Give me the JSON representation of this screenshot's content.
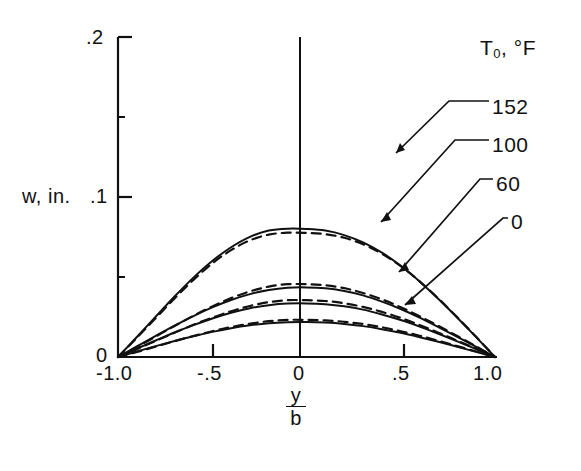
{
  "figure": {
    "kind": "line-chart",
    "background": "#ffffff",
    "ink": "#111111"
  },
  "axes": {
    "y_title": "w, in.",
    "x_title_numerator": "y",
    "x_title_denominator": "b",
    "x_ticks": [
      "-1.0",
      "-.5",
      "0",
      ".5",
      "1.0"
    ],
    "x_tick_values": [
      -1.0,
      -0.5,
      0,
      0.5,
      1.0
    ],
    "y_ticks": [
      "0",
      ".1",
      ".2"
    ],
    "y_tick_values": [
      0,
      0.1,
      0.2
    ]
  },
  "legend": {
    "title": "T",
    "title_sub": "0",
    "title_rest": ", °F",
    "title_full": "T0, °F",
    "entries": [
      {
        "label": "152",
        "value": 152
      },
      {
        "label": "100",
        "value": 100
      },
      {
        "label": "60",
        "value": 60
      },
      {
        "label": "0",
        "value": 0
      }
    ]
  },
  "chart_data": {
    "type": "line",
    "title": "",
    "subtitle": "",
    "xlabel": "y/b",
    "ylabel": "w, in.",
    "xlim": [
      -1.0,
      1.0
    ],
    "ylim": [
      0,
      0.2
    ],
    "grid": false,
    "legend_position": "right",
    "legend_title": "T0, °F",
    "x": [
      -1.0,
      -0.9,
      -0.8,
      -0.7,
      -0.6,
      -0.5,
      -0.4,
      -0.3,
      -0.2,
      -0.1,
      0.0,
      0.1,
      0.2,
      0.3,
      0.4,
      0.5,
      0.6,
      0.7,
      0.8,
      0.9,
      1.0
    ],
    "series": [
      {
        "name": "152",
        "linestyle": "solid",
        "note": "theory",
        "peak": 0.08,
        "values": [
          0.0,
          0.0125,
          0.0252,
          0.0378,
          0.0496,
          0.06,
          0.0686,
          0.0751,
          0.079,
          0.0802,
          0.08,
          0.079,
          0.0762,
          0.0716,
          0.0652,
          0.057,
          0.0472,
          0.0362,
          0.0245,
          0.0124,
          0.0
        ]
      },
      {
        "name": "152",
        "linestyle": "dashed",
        "note": "experiment",
        "peak": 0.0775,
        "values": [
          0.0,
          0.012,
          0.0243,
          0.0366,
          0.0482,
          0.0585,
          0.0668,
          0.0729,
          0.0765,
          0.0777,
          0.0775,
          0.0768,
          0.0745,
          0.0705,
          0.0646,
          0.0568,
          0.0473,
          0.0365,
          0.0248,
          0.0126,
          0.0
        ]
      },
      {
        "name": "100",
        "linestyle": "solid",
        "note": "theory",
        "peak": 0.0435,
        "values": [
          0.0,
          0.0066,
          0.0132,
          0.0196,
          0.0256,
          0.031,
          0.0356,
          0.0393,
          0.0419,
          0.0433,
          0.0435,
          0.0429,
          0.0412,
          0.0385,
          0.0346,
          0.03,
          0.0246,
          0.0187,
          0.0126,
          0.0063,
          0.0
        ]
      },
      {
        "name": "100",
        "linestyle": "dashed",
        "note": "experiment",
        "peak": 0.0455,
        "values": [
          0.0,
          0.0062,
          0.0128,
          0.0194,
          0.0258,
          0.0316,
          0.0368,
          0.041,
          0.044,
          0.0455,
          0.0455,
          0.0448,
          0.043,
          0.04,
          0.036,
          0.0311,
          0.0255,
          0.0194,
          0.0131,
          0.0066,
          0.0
        ]
      },
      {
        "name": "60",
        "linestyle": "solid",
        "note": "theory",
        "peak": 0.0335,
        "values": [
          0.0,
          0.0052,
          0.0103,
          0.0153,
          0.0199,
          0.0241,
          0.0277,
          0.0305,
          0.0324,
          0.0334,
          0.0335,
          0.033,
          0.0317,
          0.0296,
          0.0266,
          0.0231,
          0.019,
          0.0145,
          0.0098,
          0.0049,
          0.0
        ]
      },
      {
        "name": "60",
        "linestyle": "dashed",
        "note": "experiment",
        "peak": 0.0355,
        "values": [
          0.0,
          0.0049,
          0.0101,
          0.0152,
          0.0201,
          0.0246,
          0.0286,
          0.0319,
          0.0343,
          0.0355,
          0.0355,
          0.035,
          0.0336,
          0.0313,
          0.0282,
          0.0244,
          0.02,
          0.0152,
          0.0102,
          0.0051,
          0.0
        ]
      },
      {
        "name": "0",
        "linestyle": "solid",
        "note": "theory",
        "peak": 0.0218,
        "values": [
          0.0,
          0.0034,
          0.0068,
          0.01,
          0.013,
          0.0157,
          0.018,
          0.0198,
          0.0211,
          0.0217,
          0.0218,
          0.0215,
          0.0207,
          0.0193,
          0.0174,
          0.0151,
          0.0124,
          0.0095,
          0.0064,
          0.0032,
          0.0
        ]
      },
      {
        "name": "0",
        "linestyle": "dashed",
        "note": "experiment",
        "peak": 0.0232,
        "values": [
          0.0,
          0.0031,
          0.0065,
          0.0099,
          0.0131,
          0.0161,
          0.0187,
          0.0208,
          0.0224,
          0.0232,
          0.0232,
          0.0229,
          0.022,
          0.0206,
          0.0186,
          0.0161,
          0.0133,
          0.0101,
          0.0068,
          0.0034,
          0.0
        ]
      }
    ]
  }
}
